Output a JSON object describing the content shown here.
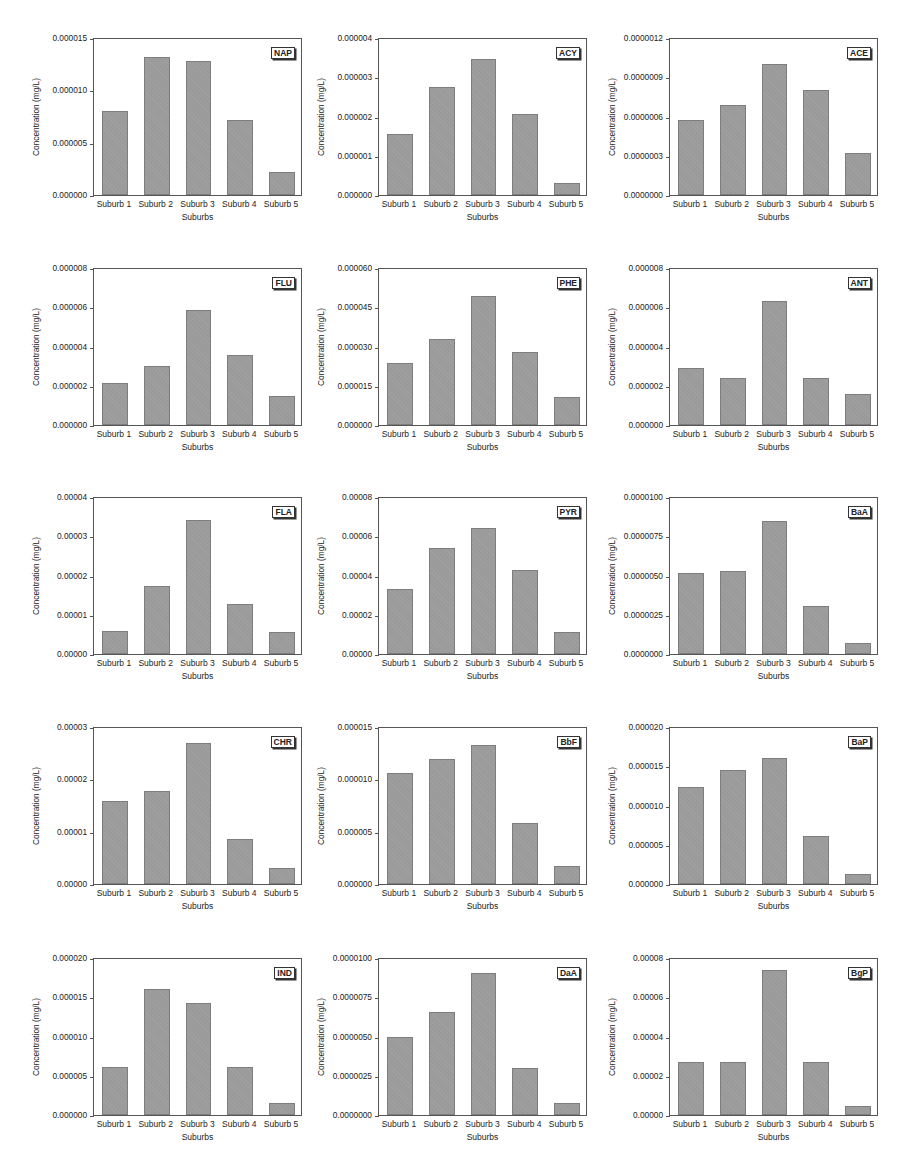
{
  "figure": {
    "xlabel": "Suburbs",
    "ylabel": "Concentration (mg/L)",
    "categories": [
      "Suburb 1",
      "Suburb 2",
      "Suburb 3",
      "Suburb 4",
      "Suburb 5"
    ],
    "bar_color": "#9a9a9a"
  },
  "chart_data": [
    {
      "type": "bar",
      "title": "NAP",
      "xlabel": "Suburbs",
      "ylabel": "Concentration (mg/L)",
      "categories": [
        "Suburb 1",
        "Suburb 2",
        "Suburb 3",
        "Suburb 4",
        "Suburb 5"
      ],
      "values": [
        8.1e-06,
        1.33e-05,
        1.29e-05,
        7.2e-06,
        2.2e-06
      ],
      "ylim": [
        0,
        1.5e-05
      ],
      "yticks": [
        "0.000000",
        "0.000005",
        "0.000010",
        "0.000015"
      ]
    },
    {
      "type": "bar",
      "title": "ACY",
      "xlabel": "Suburbs",
      "ylabel": "Concentration (mg/L)",
      "categories": [
        "Suburb 1",
        "Suburb 2",
        "Suburb 3",
        "Suburb 4",
        "Suburb 5"
      ],
      "values": [
        1.57e-06,
        2.78e-06,
        3.48e-06,
        2.08e-06,
        3e-07
      ],
      "ylim": [
        0,
        4e-06
      ],
      "yticks": [
        "0.000000",
        "0.000001",
        "0.000002",
        "0.000003",
        "0.000004"
      ]
    },
    {
      "type": "bar",
      "title": "ACE",
      "xlabel": "Suburbs",
      "ylabel": "Concentration (mg/L)",
      "categories": [
        "Suburb 1",
        "Suburb 2",
        "Suburb 3",
        "Suburb 4",
        "Suburb 5"
      ],
      "values": [
        5.8e-07,
        6.9e-07,
        1.01e-06,
        8.1e-07,
        3.2e-07
      ],
      "ylim": [
        0,
        1.2e-06
      ],
      "yticks": [
        "0.0000000",
        "0.0000003",
        "0.0000006",
        "0.0000009",
        "0.0000012"
      ]
    },
    {
      "type": "bar",
      "title": "FLU",
      "xlabel": "Suburbs",
      "ylabel": "Concentration (mg/L)",
      "categories": [
        "Suburb 1",
        "Suburb 2",
        "Suburb 3",
        "Suburb 4",
        "Suburb 5"
      ],
      "values": [
        2.15e-06,
        3.03e-06,
        5.9e-06,
        3.6e-06,
        1.48e-06
      ],
      "ylim": [
        0,
        8e-06
      ],
      "yticks": [
        "0.000000",
        "0.000002",
        "0.000004",
        "0.000006",
        "0.000008"
      ]
    },
    {
      "type": "bar",
      "title": "PHE",
      "xlabel": "Suburbs",
      "ylabel": "Concentration (mg/L)",
      "categories": [
        "Suburb 1",
        "Suburb 2",
        "Suburb 3",
        "Suburb 4",
        "Suburb 5"
      ],
      "values": [
        2.38e-05,
        3.3e-05,
        4.97e-05,
        2.8e-05,
        1.08e-05
      ],
      "ylim": [
        0,
        6e-05
      ],
      "yticks": [
        "0.000000",
        "0.000015",
        "0.000030",
        "0.000045",
        "0.000060"
      ]
    },
    {
      "type": "bar",
      "title": "ANT",
      "xlabel": "Suburbs",
      "ylabel": "Concentration (mg/L)",
      "categories": [
        "Suburb 1",
        "Suburb 2",
        "Suburb 3",
        "Suburb 4",
        "Suburb 5"
      ],
      "values": [
        2.92e-06,
        2.42e-06,
        6.37e-06,
        2.4e-06,
        1.6e-06
      ],
      "ylim": [
        0,
        8e-06
      ],
      "yticks": [
        "0.000000",
        "0.000002",
        "0.000004",
        "0.000006",
        "0.000008"
      ]
    },
    {
      "type": "bar",
      "title": "FLA",
      "xlabel": "Suburbs",
      "ylabel": "Concentration (mg/L)",
      "categories": [
        "Suburb 1",
        "Suburb 2",
        "Suburb 3",
        "Suburb 4",
        "Suburb 5"
      ],
      "values": [
        6e-06,
        1.74e-05,
        3.43e-05,
        1.27e-05,
        5.7e-06
      ],
      "ylim": [
        0,
        4e-05
      ],
      "yticks": [
        "0.00000",
        "0.00001",
        "0.00002",
        "0.00003",
        "0.00004"
      ]
    },
    {
      "type": "bar",
      "title": "PYR",
      "xlabel": "Suburbs",
      "ylabel": "Concentration (mg/L)",
      "categories": [
        "Suburb 1",
        "Suburb 2",
        "Suburb 3",
        "Suburb 4",
        "Suburb 5"
      ],
      "values": [
        3.35e-05,
        5.45e-05,
        6.48e-05,
        4.33e-05,
        1.12e-05
      ],
      "ylim": [
        0,
        8e-05
      ],
      "yticks": [
        "0.00000",
        "0.00002",
        "0.00004",
        "0.00006",
        "0.00008"
      ]
    },
    {
      "type": "bar",
      "title": "BaA",
      "xlabel": "Suburbs",
      "ylabel": "Concentration (mg/L)",
      "categories": [
        "Suburb 1",
        "Suburb 2",
        "Suburb 3",
        "Suburb 4",
        "Suburb 5"
      ],
      "values": [
        5.2e-06,
        5.3e-06,
        8.5e-06,
        3.1e-06,
        7e-07
      ],
      "ylim": [
        0,
        1e-05
      ],
      "yticks": [
        "0.0000000",
        "0.0000025",
        "0.0000050",
        "0.0000075",
        "0.0000100"
      ]
    },
    {
      "type": "bar",
      "title": "CHR",
      "xlabel": "Suburbs",
      "ylabel": "Concentration (mg/L)",
      "categories": [
        "Suburb 1",
        "Suburb 2",
        "Suburb 3",
        "Suburb 4",
        "Suburb 5"
      ],
      "values": [
        1.59e-05,
        1.79e-05,
        2.72e-05,
        8.7e-06,
        3e-06
      ],
      "ylim": [
        0,
        3e-05
      ],
      "yticks": [
        "0.00000",
        "0.00001",
        "0.00002",
        "0.00003"
      ]
    },
    {
      "type": "bar",
      "title": "BbF",
      "xlabel": "Suburbs",
      "ylabel": "Concentration (mg/L)",
      "categories": [
        "Suburb 1",
        "Suburb 2",
        "Suburb 3",
        "Suburb 4",
        "Suburb 5"
      ],
      "values": [
        1.07e-05,
        1.2e-05,
        1.34e-05,
        5.9e-06,
        1.7e-06
      ],
      "ylim": [
        0,
        1.5e-05
      ],
      "yticks": [
        "0.000000",
        "0.000005",
        "0.000010",
        "0.000015"
      ]
    },
    {
      "type": "bar",
      "title": "BaP",
      "xlabel": "Suburbs",
      "ylabel": "Concentration (mg/L)",
      "categories": [
        "Suburb 1",
        "Suburb 2",
        "Suburb 3",
        "Suburb 4",
        "Suburb 5"
      ],
      "values": [
        1.24e-05,
        1.46e-05,
        1.62e-05,
        6.1e-06,
        1.3e-06
      ],
      "ylim": [
        0,
        2e-05
      ],
      "yticks": [
        "0.000000",
        "0.000005",
        "0.000010",
        "0.000015",
        "0.000020"
      ]
    },
    {
      "type": "bar",
      "title": "IND",
      "xlabel": "Suburbs",
      "ylabel": "Concentration (mg/L)",
      "categories": [
        "Suburb 1",
        "Suburb 2",
        "Suburb 3",
        "Suburb 4",
        "Suburb 5"
      ],
      "values": [
        6.2e-06,
        1.61e-05,
        1.44e-05,
        6.2e-06,
        1.5e-06
      ],
      "ylim": [
        0,
        2e-05
      ],
      "yticks": [
        "0.000000",
        "0.000005",
        "0.000010",
        "0.000015",
        "0.000020"
      ]
    },
    {
      "type": "bar",
      "title": "DaA",
      "xlabel": "Suburbs",
      "ylabel": "Concentration (mg/L)",
      "categories": [
        "Suburb 1",
        "Suburb 2",
        "Suburb 3",
        "Suburb 4",
        "Suburb 5"
      ],
      "values": [
        5e-06,
        6.6e-06,
        9.1e-06,
        3e-06,
        8e-07
      ],
      "ylim": [
        0,
        1e-05
      ],
      "yticks": [
        "0.0000000",
        "0.0000025",
        "0.0000050",
        "0.0000075",
        "0.0000100"
      ]
    },
    {
      "type": "bar",
      "title": "BgP",
      "xlabel": "Suburbs",
      "ylabel": "Concentration (mg/L)",
      "categories": [
        "Suburb 1",
        "Suburb 2",
        "Suburb 3",
        "Suburb 4",
        "Suburb 5"
      ],
      "values": [
        2.7e-05,
        2.7e-05,
        7.45e-05,
        2.7e-05,
        4.8e-06
      ],
      "ylim": [
        0,
        8e-05
      ],
      "yticks": [
        "0.00000",
        "0.00002",
        "0.00004",
        "0.00006",
        "0.00008"
      ]
    }
  ]
}
